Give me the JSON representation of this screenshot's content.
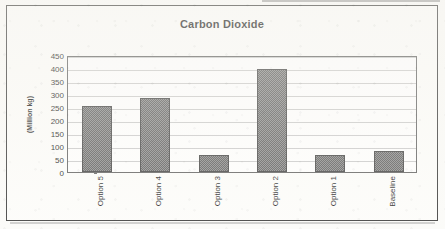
{
  "chart_data": {
    "type": "bar",
    "title": "Carbon Dioxide",
    "xlabel": "",
    "ylabel": "(Million kg)",
    "categories": [
      "Option 5",
      "Option 4",
      "Option 3",
      "Option 2",
      "Option 1",
      "Baseline"
    ],
    "values": [
      255,
      285,
      65,
      395,
      65,
      80
    ],
    "ylim": [
      0,
      450
    ],
    "ytick_step": 50,
    "yticks": [
      0,
      50,
      100,
      150,
      200,
      250,
      300,
      350,
      400,
      450
    ],
    "ytick_labels": [
      "0",
      "50",
      "100",
      "150",
      "200",
      "250",
      "300",
      "350",
      "400",
      "450"
    ],
    "grid": true,
    "legend": false,
    "series": [
      {
        "name": "Carbon Dioxide",
        "values": [
          255,
          285,
          65,
          395,
          65,
          80
        ],
        "color": "#7a7a7a"
      }
    ],
    "bar_fill_color": "#7a7a7a",
    "bar_border_color": "#3b3b3b",
    "plot_border_color": "#5a5a5a",
    "gridline_color": "#c9c9c9",
    "frame_border_color": "#2f2f2f",
    "background_color": "#fdfdfb"
  }
}
